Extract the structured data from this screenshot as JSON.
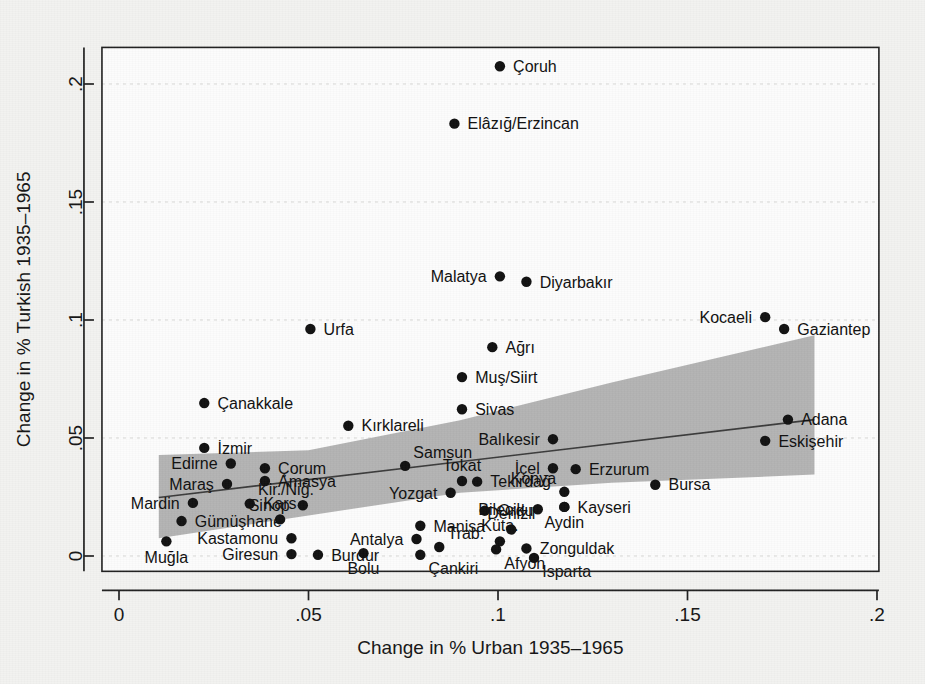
{
  "chart_data": {
    "type": "scatter",
    "title": "",
    "xlabel": "Change in % Urban 1935–1965",
    "ylabel": "Change in % Turkish 1935–1965",
    "xlim": [
      -0.0045,
      0.2005
    ],
    "ylim": [
      -0.0065,
      0.2155
    ],
    "xticks": [
      0,
      0.05,
      0.1,
      0.15,
      0.2
    ],
    "xticklabels": [
      "0",
      ".05",
      ".1",
      ".15",
      ".2"
    ],
    "yticks": [
      0,
      0.05,
      0.1,
      0.15,
      0.2
    ],
    "yticklabels": [
      "0",
      ".05",
      ".1",
      ".15",
      ".2"
    ],
    "grid": true,
    "legend": "none",
    "marker_color": "#111111",
    "ci_band_color": "#b3b3b3",
    "fit_line_color": "#3b3b3b",
    "fit_line": {
      "x0": 0.0105,
      "y0": 0.0248,
      "x1": 0.1835,
      "y1": 0.0578
    },
    "ci_band": {
      "upper": [
        [
          0.0105,
          0.0428
        ],
        [
          0.05,
          0.0448
        ],
        [
          0.09,
          0.0575
        ],
        [
          0.13,
          0.0735
        ],
        [
          0.1835,
          0.0935
        ]
      ],
      "lower": [
        [
          0.0105,
          0.0075
        ],
        [
          0.05,
          0.0172
        ],
        [
          0.09,
          0.0268
        ],
        [
          0.13,
          0.031
        ],
        [
          0.1835,
          0.0345
        ]
      ]
    },
    "points": [
      {
        "label": "Çoruh",
        "x": 0.1005,
        "y": 0.2075,
        "label_pos": "right"
      },
      {
        "label": "Elâzığ/Erzincan",
        "x": 0.0885,
        "y": 0.1832,
        "label_pos": "right"
      },
      {
        "label": "Malatya",
        "x": 0.1005,
        "y": 0.1185,
        "label_pos": "left"
      },
      {
        "label": "Diyarbakır",
        "x": 0.1075,
        "y": 0.1162,
        "label_pos": "right"
      },
      {
        "label": "Kocaeli",
        "x": 0.1705,
        "y": 0.1012,
        "label_pos": "left"
      },
      {
        "label": "Gaziantep",
        "x": 0.1755,
        "y": 0.0962,
        "label_pos": "right"
      },
      {
        "label": "Urfa",
        "x": 0.0505,
        "y": 0.0962,
        "label_pos": "right"
      },
      {
        "label": "Ağrı",
        "x": 0.0985,
        "y": 0.0885,
        "label_pos": "right"
      },
      {
        "label": "Muş/Siirt",
        "x": 0.0905,
        "y": 0.0758,
        "label_pos": "right"
      },
      {
        "label": "Çanakkale",
        "x": 0.0225,
        "y": 0.0648,
        "label_pos": "right"
      },
      {
        "label": "Sivas",
        "x": 0.0905,
        "y": 0.0622,
        "label_pos": "right"
      },
      {
        "label": "Adana",
        "x": 0.1765,
        "y": 0.0578,
        "label_pos": "right"
      },
      {
        "label": "Kırklareli",
        "x": 0.0605,
        "y": 0.0552,
        "label_pos": "right"
      },
      {
        "label": "Balıkesir",
        "x": 0.1145,
        "y": 0.0495,
        "label_pos": "left"
      },
      {
        "label": "Eskişehir",
        "x": 0.1705,
        "y": 0.0488,
        "label_pos": "right"
      },
      {
        "label": "İzmir",
        "x": 0.0225,
        "y": 0.0458,
        "label_pos": "right"
      },
      {
        "label": "Edirne",
        "x": 0.0295,
        "y": 0.0392,
        "label_pos": "left"
      },
      {
        "label": "Çorum",
        "x": 0.0385,
        "y": 0.0372,
        "label_pos": "right"
      },
      {
        "label": "Samsun",
        "x": 0.0755,
        "y": 0.0382,
        "label_pos": "above-right"
      },
      {
        "label": "İçel",
        "x": 0.1145,
        "y": 0.0372,
        "label_pos": "left"
      },
      {
        "label": "Erzurum",
        "x": 0.1205,
        "y": 0.0368,
        "label_pos": "right"
      },
      {
        "label": "Maraş",
        "x": 0.0285,
        "y": 0.0305,
        "label_pos": "left"
      },
      {
        "label": "Amasya",
        "x": 0.0385,
        "y": 0.0318,
        "label_pos": "right"
      },
      {
        "label": "Tokat",
        "x": 0.0905,
        "y": 0.0318,
        "label_pos": "above"
      },
      {
        "label": "Yozgat",
        "x": 0.0875,
        "y": 0.0268,
        "label_pos": "left"
      },
      {
        "label": "Tekirdağ",
        "x": 0.0945,
        "y": 0.0315,
        "label_pos": "right"
      },
      {
        "label": "Bursa",
        "x": 0.1415,
        "y": 0.0302,
        "label_pos": "right"
      },
      {
        "label": "Mardin",
        "x": 0.0195,
        "y": 0.0225,
        "label_pos": "left"
      },
      {
        "label": "Kir./Niğ.",
        "x": 0.0345,
        "y": 0.0222,
        "label_pos": "above-right"
      },
      {
        "label": "Sinop",
        "x": 0.0485,
        "y": 0.0215,
        "label_pos": "left"
      },
      {
        "label": "Konya",
        "x": 0.1175,
        "y": 0.0272,
        "label_pos": "below-left"
      },
      {
        "label": "Kayseri",
        "x": 0.1175,
        "y": 0.0208,
        "label_pos": "right"
      },
      {
        "label": "Bilecik",
        "x": 0.1105,
        "y": 0.0198,
        "label_pos": "left"
      },
      {
        "label": "Ordu",
        "x": 0.0965,
        "y": 0.0192,
        "label_pos": "right"
      },
      {
        "label": "Gümüşhane",
        "x": 0.0165,
        "y": 0.0148,
        "label_pos": "right"
      },
      {
        "label": "Kars",
        "x": 0.0425,
        "y": 0.0155,
        "label_pos": "above"
      },
      {
        "label": "Manisa",
        "x": 0.0795,
        "y": 0.0128,
        "label_pos": "right"
      },
      {
        "label": "Denizli",
        "x": 0.1035,
        "y": 0.0112,
        "label_pos": "above"
      },
      {
        "label": "Aydin",
        "x": 0.1175,
        "y": 0.0208,
        "label_pos": "below"
      },
      {
        "label": "Kastamonu",
        "x": 0.0455,
        "y": 0.0075,
        "label_pos": "left"
      },
      {
        "label": "Antalya",
        "x": 0.0785,
        "y": 0.0072,
        "label_pos": "left"
      },
      {
        "label": "Küta.",
        "x": 0.1005,
        "y": 0.0062,
        "label_pos": "above"
      },
      {
        "label": "Muğla",
        "x": 0.0125,
        "y": 0.0062,
        "label_pos": "below"
      },
      {
        "label": "Trab.",
        "x": 0.0845,
        "y": 0.0038,
        "label_pos": "above-right"
      },
      {
        "label": "Zonguldak",
        "x": 0.1075,
        "y": 0.0032,
        "label_pos": "right"
      },
      {
        "label": "Giresun",
        "x": 0.0455,
        "y": 0.0008,
        "label_pos": "left"
      },
      {
        "label": "Burdur",
        "x": 0.0525,
        "y": 0.0005,
        "label_pos": "right"
      },
      {
        "label": "Bolu",
        "x": 0.0645,
        "y": 0.0012,
        "label_pos": "below"
      },
      {
        "label": "Afyon",
        "x": 0.0995,
        "y": 0.0028,
        "label_pos": "below-right"
      },
      {
        "label": "Çankiri",
        "x": 0.0795,
        "y": 0.0005,
        "label_pos": "below-right"
      },
      {
        "label": "Isparta",
        "x": 0.1095,
        "y": -0.0008,
        "label_pos": "below-right"
      }
    ]
  },
  "axis": {
    "x_title": "Change in % Urban 1935–1965",
    "y_title": "Change in % Turkish 1935–1965",
    "x_tick_labels": [
      "0",
      ".05",
      ".1",
      ".15",
      ".2"
    ],
    "y_tick_labels": [
      "0",
      ".05",
      ".1",
      ".15",
      ".2"
    ]
  }
}
